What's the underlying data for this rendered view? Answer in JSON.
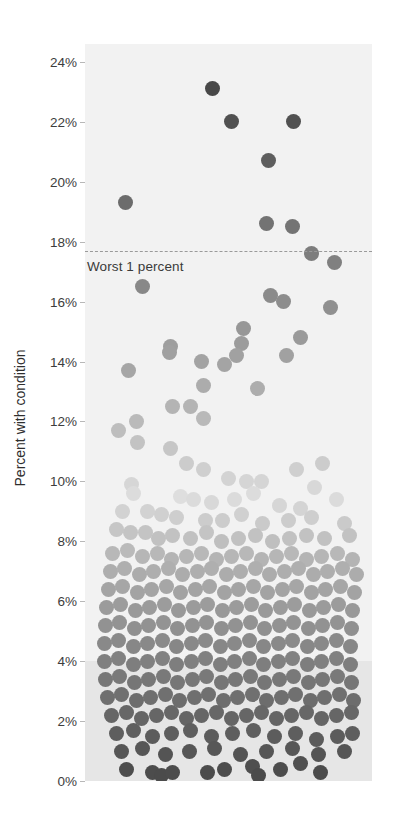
{
  "chart_data": {
    "type": "scatter",
    "title": "",
    "xlabel": "",
    "ylabel": "Percent with condition",
    "ylim": [
      0,
      24.6
    ],
    "ytick_labels": [
      "24%",
      "22%",
      "20%",
      "18%",
      "16%",
      "14%",
      "12%",
      "10%",
      "8%",
      "6%",
      "4%",
      "2%",
      "0%"
    ],
    "ytick_values": [
      24,
      22,
      20,
      18,
      16,
      14,
      12,
      10,
      8,
      6,
      4,
      2,
      0
    ],
    "grid": false,
    "legend": "none",
    "annotations": [
      {
        "name": "threshold",
        "label": "Worst 1 percent",
        "value": 17.7,
        "style": "dashed-line"
      }
    ],
    "shaded_band": {
      "from": 0,
      "to": 4,
      "color": "#e6e6e6"
    },
    "plot_background": "#f2f2f2",
    "marker": {
      "shape": "circle",
      "diameter_px": 15,
      "colormap": "grayscale-by-value"
    },
    "note": "Beeswarm / jittered dot plot. Each point is one unit; y = percent with condition. Darker dots at the extremes, lightest near 9-10%.",
    "points": [
      [
        212,
        23.1
      ],
      [
        231,
        22.0
      ],
      [
        293,
        22.0
      ],
      [
        268,
        20.7
      ],
      [
        125,
        19.3
      ],
      [
        266,
        18.6
      ],
      [
        292,
        18.5
      ],
      [
        311,
        17.6
      ],
      [
        334,
        17.3
      ],
      [
        142,
        16.5
      ],
      [
        270,
        16.2
      ],
      [
        283,
        16.0
      ],
      [
        330,
        15.8
      ],
      [
        243,
        15.1
      ],
      [
        241,
        14.6
      ],
      [
        236,
        14.2
      ],
      [
        286,
        14.2
      ],
      [
        170,
        14.5
      ],
      [
        169,
        14.3
      ],
      [
        300,
        14.8
      ],
      [
        201,
        14.0
      ],
      [
        224,
        13.9
      ],
      [
        128,
        13.7
      ],
      [
        203,
        13.2
      ],
      [
        257,
        13.1
      ],
      [
        172,
        12.5
      ],
      [
        190,
        12.5
      ],
      [
        203,
        12.1
      ],
      [
        136,
        12.0
      ],
      [
        118,
        11.7
      ],
      [
        137,
        11.3
      ],
      [
        170,
        11.1
      ],
      [
        186,
        10.6
      ],
      [
        203,
        10.4
      ],
      [
        296,
        10.4
      ],
      [
        322,
        10.6
      ],
      [
        228,
        10.1
      ],
      [
        246,
        10.0
      ],
      [
        261,
        10.0
      ],
      [
        314,
        9.8
      ],
      [
        131,
        9.9
      ],
      [
        133,
        9.6
      ],
      [
        180,
        9.5
      ],
      [
        193,
        9.4
      ],
      [
        211,
        9.3
      ],
      [
        234,
        9.4
      ],
      [
        253,
        9.6
      ],
      [
        279,
        9.2
      ],
      [
        300,
        9.1
      ],
      [
        336,
        9.4
      ],
      [
        122,
        9.0
      ],
      [
        147,
        9.0
      ],
      [
        161,
        8.9
      ],
      [
        176,
        8.8
      ],
      [
        205,
        8.7
      ],
      [
        222,
        8.7
      ],
      [
        241,
        8.9
      ],
      [
        262,
        8.6
      ],
      [
        288,
        8.7
      ],
      [
        311,
        8.8
      ],
      [
        344,
        8.6
      ],
      [
        116,
        8.4
      ],
      [
        130,
        8.3
      ],
      [
        145,
        8.3
      ],
      [
        158,
        8.1
      ],
      [
        172,
        8.2
      ],
      [
        190,
        8.1
      ],
      [
        206,
        8.3
      ],
      [
        221,
        8.0
      ],
      [
        238,
        8.1
      ],
      [
        255,
        8.2
      ],
      [
        272,
        8.0
      ],
      [
        289,
        8.1
      ],
      [
        306,
        8.2
      ],
      [
        324,
        8.1
      ],
      [
        349,
        8.2
      ],
      [
        112,
        7.6
      ],
      [
        127,
        7.7
      ],
      [
        142,
        7.5
      ],
      [
        157,
        7.6
      ],
      [
        171,
        7.4
      ],
      [
        186,
        7.5
      ],
      [
        201,
        7.6
      ],
      [
        216,
        7.4
      ],
      [
        231,
        7.5
      ],
      [
        246,
        7.6
      ],
      [
        261,
        7.4
      ],
      [
        276,
        7.5
      ],
      [
        291,
        7.6
      ],
      [
        306,
        7.4
      ],
      [
        321,
        7.5
      ],
      [
        337,
        7.6
      ],
      [
        352,
        7.4
      ],
      [
        110,
        7.0
      ],
      [
        124,
        7.1
      ],
      [
        139,
        6.9
      ],
      [
        153,
        7.0
      ],
      [
        168,
        7.1
      ],
      [
        182,
        6.9
      ],
      [
        197,
        7.0
      ],
      [
        211,
        7.1
      ],
      [
        226,
        6.9
      ],
      [
        240,
        7.0
      ],
      [
        255,
        7.1
      ],
      [
        269,
        6.9
      ],
      [
        284,
        7.0
      ],
      [
        298,
        7.1
      ],
      [
        313,
        6.9
      ],
      [
        327,
        7.0
      ],
      [
        342,
        7.1
      ],
      [
        356,
        6.9
      ],
      [
        108,
        6.4
      ],
      [
        122,
        6.5
      ],
      [
        137,
        6.3
      ],
      [
        151,
        6.4
      ],
      [
        166,
        6.5
      ],
      [
        180,
        6.3
      ],
      [
        195,
        6.4
      ],
      [
        209,
        6.5
      ],
      [
        224,
        6.3
      ],
      [
        238,
        6.4
      ],
      [
        253,
        6.5
      ],
      [
        267,
        6.3
      ],
      [
        282,
        6.4
      ],
      [
        296,
        6.5
      ],
      [
        311,
        6.3
      ],
      [
        325,
        6.4
      ],
      [
        340,
        6.5
      ],
      [
        354,
        6.3
      ],
      [
        106,
        5.8
      ],
      [
        120,
        5.9
      ],
      [
        135,
        5.7
      ],
      [
        149,
        5.8
      ],
      [
        164,
        5.9
      ],
      [
        178,
        5.7
      ],
      [
        193,
        5.8
      ],
      [
        207,
        5.9
      ],
      [
        222,
        5.7
      ],
      [
        236,
        5.8
      ],
      [
        251,
        5.9
      ],
      [
        265,
        5.7
      ],
      [
        280,
        5.8
      ],
      [
        294,
        5.9
      ],
      [
        309,
        5.7
      ],
      [
        323,
        5.8
      ],
      [
        338,
        5.9
      ],
      [
        352,
        5.7
      ],
      [
        105,
        5.2
      ],
      [
        119,
        5.3
      ],
      [
        134,
        5.1
      ],
      [
        148,
        5.2
      ],
      [
        163,
        5.3
      ],
      [
        177,
        5.1
      ],
      [
        192,
        5.2
      ],
      [
        206,
        5.3
      ],
      [
        221,
        5.1
      ],
      [
        235,
        5.2
      ],
      [
        250,
        5.3
      ],
      [
        264,
        5.1
      ],
      [
        279,
        5.2
      ],
      [
        293,
        5.3
      ],
      [
        308,
        5.1
      ],
      [
        322,
        5.2
      ],
      [
        337,
        5.3
      ],
      [
        351,
        5.1
      ],
      [
        104,
        4.6
      ],
      [
        118,
        4.7
      ],
      [
        133,
        4.5
      ],
      [
        147,
        4.6
      ],
      [
        162,
        4.7
      ],
      [
        176,
        4.5
      ],
      [
        191,
        4.6
      ],
      [
        205,
        4.7
      ],
      [
        220,
        4.5
      ],
      [
        234,
        4.6
      ],
      [
        249,
        4.7
      ],
      [
        263,
        4.5
      ],
      [
        278,
        4.6
      ],
      [
        292,
        4.7
      ],
      [
        307,
        4.5
      ],
      [
        321,
        4.6
      ],
      [
        336,
        4.7
      ],
      [
        350,
        4.5
      ],
      [
        104,
        4.0
      ],
      [
        118,
        4.1
      ],
      [
        133,
        3.9
      ],
      [
        147,
        4.0
      ],
      [
        162,
        4.1
      ],
      [
        176,
        3.9
      ],
      [
        191,
        4.0
      ],
      [
        205,
        4.1
      ],
      [
        220,
        3.9
      ],
      [
        234,
        4.0
      ],
      [
        249,
        4.1
      ],
      [
        263,
        3.9
      ],
      [
        278,
        4.0
      ],
      [
        292,
        4.1
      ],
      [
        307,
        3.9
      ],
      [
        321,
        4.0
      ],
      [
        336,
        4.1
      ],
      [
        350,
        3.9
      ],
      [
        105,
        3.4
      ],
      [
        119,
        3.5
      ],
      [
        134,
        3.3
      ],
      [
        148,
        3.4
      ],
      [
        163,
        3.5
      ],
      [
        177,
        3.3
      ],
      [
        192,
        3.4
      ],
      [
        206,
        3.5
      ],
      [
        221,
        3.3
      ],
      [
        235,
        3.4
      ],
      [
        250,
        3.5
      ],
      [
        264,
        3.3
      ],
      [
        279,
        3.4
      ],
      [
        293,
        3.5
      ],
      [
        308,
        3.3
      ],
      [
        322,
        3.4
      ],
      [
        337,
        3.5
      ],
      [
        351,
        3.3
      ],
      [
        107,
        2.8
      ],
      [
        121,
        2.9
      ],
      [
        136,
        2.7
      ],
      [
        150,
        2.8
      ],
      [
        165,
        2.9
      ],
      [
        179,
        2.7
      ],
      [
        194,
        2.8
      ],
      [
        208,
        2.9
      ],
      [
        223,
        2.7
      ],
      [
        237,
        2.8
      ],
      [
        252,
        2.9
      ],
      [
        266,
        2.7
      ],
      [
        281,
        2.8
      ],
      [
        295,
        2.9
      ],
      [
        310,
        2.7
      ],
      [
        324,
        2.8
      ],
      [
        339,
        2.9
      ],
      [
        353,
        2.7
      ],
      [
        111,
        2.2
      ],
      [
        126,
        2.3
      ],
      [
        141,
        2.1
      ],
      [
        156,
        2.2
      ],
      [
        171,
        2.3
      ],
      [
        186,
        2.1
      ],
      [
        201,
        2.2
      ],
      [
        216,
        2.3
      ],
      [
        231,
        2.1
      ],
      [
        246,
        2.2
      ],
      [
        261,
        2.3
      ],
      [
        276,
        2.1
      ],
      [
        291,
        2.2
      ],
      [
        306,
        2.3
      ],
      [
        321,
        2.1
      ],
      [
        336,
        2.2
      ],
      [
        351,
        2.3
      ],
      [
        116,
        1.6
      ],
      [
        133,
        1.7
      ],
      [
        152,
        1.5
      ],
      [
        171,
        1.6
      ],
      [
        190,
        1.7
      ],
      [
        211,
        1.5
      ],
      [
        232,
        1.6
      ],
      [
        253,
        1.7
      ],
      [
        274,
        1.5
      ],
      [
        295,
        1.6
      ],
      [
        316,
        1.4
      ],
      [
        337,
        1.5
      ],
      [
        352,
        1.6
      ],
      [
        121,
        1.0
      ],
      [
        142,
        1.1
      ],
      [
        165,
        0.9
      ],
      [
        189,
        1.0
      ],
      [
        214,
        1.1
      ],
      [
        240,
        0.9
      ],
      [
        266,
        1.0
      ],
      [
        292,
        1.1
      ],
      [
        318,
        0.9
      ],
      [
        344,
        1.0
      ],
      [
        126,
        0.4
      ],
      [
        152,
        0.3
      ],
      [
        161,
        0.2
      ],
      [
        172,
        0.3
      ],
      [
        207,
        0.3
      ],
      [
        224,
        0.4
      ],
      [
        252,
        0.5
      ],
      [
        258,
        0.2
      ],
      [
        280,
        0.4
      ],
      [
        300,
        0.6
      ],
      [
        320,
        0.3
      ]
    ]
  },
  "axis": {
    "title": "Percent with condition"
  },
  "annotation": {
    "threshold_label": "Worst 1 percent"
  }
}
